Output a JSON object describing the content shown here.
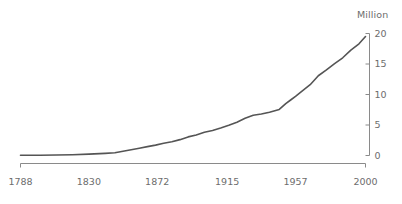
{
  "chart_data": {
    "type": "line",
    "title": "",
    "subtitle": "",
    "xlabel": "",
    "ylabel": "",
    "unit_label": "Million",
    "legend": [],
    "legend_position": "none",
    "grid": false,
    "axis_style": {
      "y_axis_side": "right",
      "x_axis_side": "bottom",
      "line_color": "#8a8a8a",
      "series_color": "#555555",
      "text_color": "#6d6d6d"
    },
    "xlim": [
      1788,
      2000
    ],
    "ylim": [
      0,
      20
    ],
    "xticks": [
      1788,
      1830,
      1872,
      1915,
      1957,
      2000
    ],
    "xtick_labels": [
      "1788",
      "1830",
      "1872",
      "1915",
      "1957",
      "2000"
    ],
    "yticks": [
      0,
      5,
      10,
      15,
      20
    ],
    "ytick_labels": [
      "0",
      "5",
      "10",
      "15",
      "20"
    ],
    "series": [
      {
        "name": "Population",
        "color": "#555555",
        "x": [
          1788,
          1800,
          1810,
          1820,
          1830,
          1840,
          1846,
          1851,
          1856,
          1861,
          1866,
          1871,
          1876,
          1881,
          1886,
          1891,
          1896,
          1901,
          1906,
          1911,
          1916,
          1921,
          1926,
          1931,
          1936,
          1941,
          1947,
          1951,
          1954,
          1957,
          1961,
          1966,
          1971,
          1976,
          1981,
          1986,
          1991,
          1996,
          2000
        ],
        "y": [
          0.03,
          0.05,
          0.08,
          0.13,
          0.22,
          0.35,
          0.45,
          0.7,
          0.95,
          1.2,
          1.45,
          1.7,
          2.0,
          2.25,
          2.6,
          3.05,
          3.35,
          3.8,
          4.1,
          4.5,
          4.95,
          5.45,
          6.1,
          6.6,
          6.8,
          7.1,
          7.55,
          8.5,
          9.1,
          9.7,
          10.55,
          11.6,
          13.07,
          14.03,
          15.05,
          16.02,
          17.28,
          18.31,
          19.5
        ]
      }
    ],
    "annotations": []
  }
}
